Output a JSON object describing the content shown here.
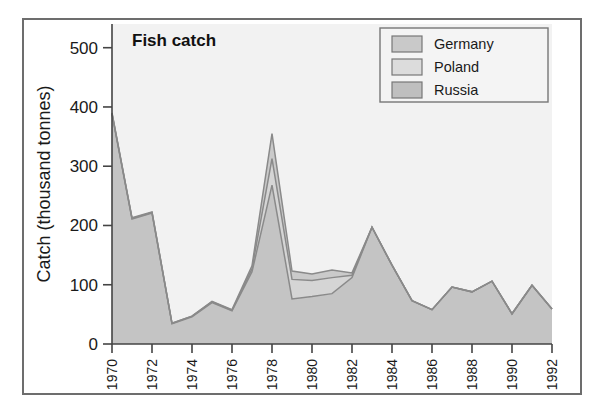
{
  "figure": {
    "background": "#ffffff",
    "frame_color": "#6d6d6d",
    "plot_background": "#f2f2f2"
  },
  "chart_data": {
    "type": "area",
    "title": "Fish catch",
    "xlabel": "",
    "ylabel": "Catch (thousand tonnes)",
    "ylim": [
      0,
      540
    ],
    "xlim": [
      1970,
      1992
    ],
    "grid": false,
    "legend_position": "top-right",
    "stacked": true,
    "x": [
      1970,
      1971,
      1972,
      1973,
      1974,
      1975,
      1976,
      1977,
      1978,
      1979,
      1980,
      1981,
      1982,
      1983,
      1984,
      1985,
      1986,
      1987,
      1988,
      1989,
      1990,
      1991,
      1992
    ],
    "xtick_labels": [
      "1970",
      "1972",
      "1974",
      "1976",
      "1978",
      "1980",
      "1982",
      "1984",
      "1986",
      "1988",
      "1990",
      "1992"
    ],
    "xticks": [
      1970,
      1972,
      1974,
      1976,
      1978,
      1980,
      1982,
      1984,
      1986,
      1988,
      1990,
      1992
    ],
    "ytick_labels": [
      "0",
      "100",
      "200",
      "300",
      "400",
      "500"
    ],
    "yticks": [
      0,
      100,
      200,
      300,
      400,
      500
    ],
    "series": [
      {
        "name": "Russia",
        "color": "#c4c4c4",
        "legend_swatch": "#bfbfbf",
        "values": [
          388,
          211,
          221,
          34,
          46,
          70,
          56,
          122,
          268,
          76,
          80,
          85,
          112,
          197,
          133,
          73,
          58,
          96,
          88,
          106,
          51,
          99,
          59
        ]
      },
      {
        "name": "Poland",
        "color": "#d5d5d5",
        "legend_swatch": "#dcdcdc",
        "values": [
          1,
          1,
          1,
          1,
          1,
          1,
          1,
          5,
          45,
          33,
          27,
          27,
          4,
          0,
          0,
          0,
          0,
          0,
          0,
          0,
          0,
          0,
          0
        ]
      },
      {
        "name": "Germany",
        "color": "#cacaca",
        "legend_swatch": "#c9c9c9",
        "values": [
          1,
          1,
          1,
          0,
          0,
          1,
          1,
          5,
          42,
          14,
          11,
          13,
          4,
          0,
          0,
          0,
          0,
          0,
          0,
          0,
          0,
          0,
          0
        ]
      }
    ],
    "totals": [
      390,
      213,
      223,
      35,
      46,
      71,
      57,
      132,
      355,
      123,
      118,
      125,
      120,
      197,
      133,
      73,
      58,
      96,
      88,
      106,
      51,
      99,
      59
    ],
    "annotations": []
  },
  "legend": {
    "entries": [
      {
        "label": "Germany"
      },
      {
        "label": "Poland"
      },
      {
        "label": "Russia"
      }
    ]
  }
}
